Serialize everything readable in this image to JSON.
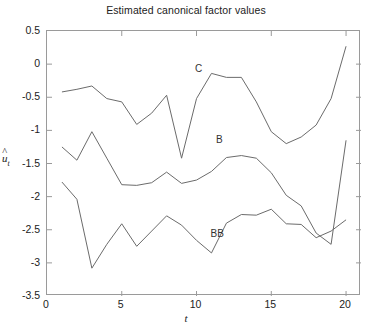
{
  "chart_data": {
    "type": "line",
    "title": "Estimated canonical factor values",
    "xlabel": "t",
    "ylabel": "ûₜ",
    "xlim": [
      0,
      21
    ],
    "ylim": [
      -3.5,
      0.5
    ],
    "xticks": [
      0,
      5,
      10,
      15,
      20
    ],
    "yticks": [
      0.5,
      0,
      -0.5,
      -1,
      -1.5,
      -2,
      -2.5,
      -3,
      -3.5
    ],
    "xtick_labels": [
      "0",
      "5",
      "10",
      "15",
      "20"
    ],
    "ytick_labels": [
      "0.5",
      "0",
      "-0.5",
      "-1",
      "-1.5",
      "-2",
      "-2.5",
      "-3",
      "-3.5"
    ],
    "grid": false,
    "legend": "inline-annotations",
    "x": [
      1,
      2,
      3,
      4,
      5,
      6,
      7,
      8,
      9,
      10,
      11,
      12,
      13,
      14,
      15,
      16,
      17,
      18,
      19,
      20
    ],
    "series": [
      {
        "name": "C",
        "label": "C",
        "label_x": 10.2,
        "label_y": -0.08,
        "values": [
          -0.42,
          -0.38,
          -0.33,
          -0.52,
          -0.57,
          -0.91,
          -0.74,
          -0.47,
          -1.42,
          -0.52,
          -0.14,
          -0.2,
          -0.2,
          -0.57,
          -1.02,
          -1.2,
          -1.1,
          -0.92,
          -0.52,
          0.27
        ]
      },
      {
        "name": "B",
        "label": "B",
        "label_x": 11.6,
        "label_y": -1.14,
        "values": [
          -1.25,
          -1.45,
          -1.02,
          -1.42,
          -1.82,
          -1.83,
          -1.79,
          -1.63,
          -1.8,
          -1.75,
          -1.62,
          -1.41,
          -1.38,
          -1.42,
          -1.64,
          -1.98,
          -2.14,
          -2.55,
          -2.72,
          -1.15
        ]
      },
      {
        "name": "BB",
        "label": "BB",
        "label_x": 11.45,
        "label_y": -2.56,
        "values": [
          -1.78,
          -2.04,
          -3.08,
          -2.72,
          -2.41,
          -2.75,
          -2.52,
          -2.29,
          -2.43,
          -2.66,
          -2.85,
          -2.4,
          -2.27,
          -2.28,
          -2.19,
          -2.41,
          -2.42,
          -2.62,
          -2.52,
          -2.35
        ]
      }
    ],
    "line_color": "#6b6b6b",
    "axis_color": "#9a9a9a"
  }
}
